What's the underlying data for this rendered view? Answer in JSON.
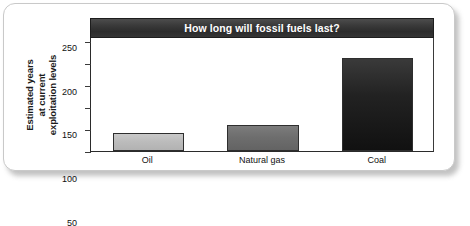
{
  "chart_data": {
    "type": "bar",
    "title": "How long will fossil fuels last?",
    "xlabel": "",
    "ylabel": "Estimated years at current exploitation levels",
    "ylabel_lines": [
      "Estimated years",
      "at current",
      "exploitation levels"
    ],
    "categories": [
      "Oil",
      "Natural gas",
      "Coal"
    ],
    "values": [
      40,
      60,
      213
    ],
    "ylim": [
      0,
      260
    ],
    "yticks": [
      0,
      50,
      100,
      150,
      200,
      250
    ],
    "ytick_labels": [
      "0",
      "50",
      "100",
      "150",
      "200",
      "250"
    ],
    "grid": false,
    "legend": "none",
    "bar_colors": [
      "#bcbcbc",
      "#6e6e6e",
      "#1a1a1a"
    ],
    "series": [
      {
        "name": "Estimated years at current exploitation levels",
        "values": [
          40,
          60,
          213
        ]
      }
    ]
  },
  "figure": {
    "title_banner_color": "#333333",
    "title_text_color": "#ffffff",
    "frame_color": "#2b2b2b",
    "background": "#ffffff"
  }
}
